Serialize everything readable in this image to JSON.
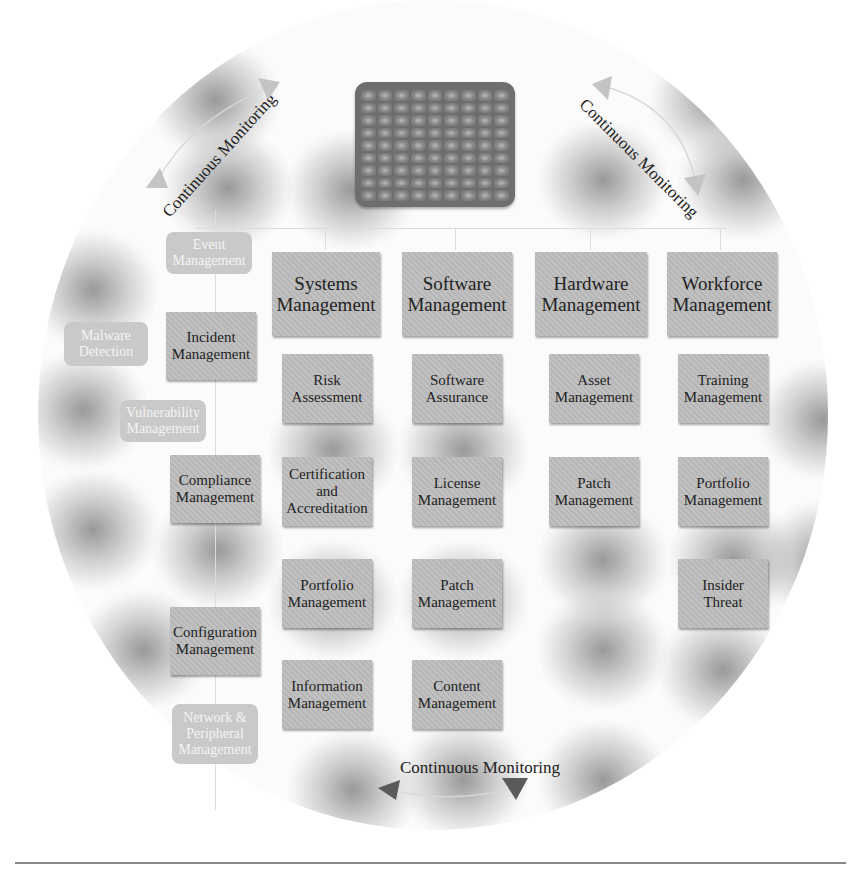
{
  "diagram": {
    "hub": {
      "icon": "server-grid-icon",
      "rows": 9,
      "cols": 9
    },
    "cycle_labels": [
      {
        "id": "top-left",
        "label": "Continuous Monitoring"
      },
      {
        "id": "top-right",
        "label": "Continuous Monitoring"
      },
      {
        "id": "bottom",
        "label": "Continuous Monitoring"
      }
    ],
    "columns": [
      {
        "header": "Systems\nManagement",
        "items": [
          "Risk\nAssessment",
          "Certification\nand\nAccreditation",
          "Portfolio\nManagement",
          "Information\nManagement"
        ]
      },
      {
        "header": "Software\nManagement",
        "items": [
          "Software\nAssurance",
          "License\nManagement",
          "Patch\nManagement",
          "Content\nManagement"
        ]
      },
      {
        "header": "Hardware\nManagement",
        "items": [
          "Asset\nManagement",
          "Patch\nManagement"
        ]
      },
      {
        "header": "Workforce\nManagement",
        "items": [
          "Training\nManagement",
          "Portfolio\nManagement",
          "Insider\nThreat"
        ]
      }
    ],
    "left_chain": {
      "main": [
        "Incident\nManagement",
        "Compliance\nManagement",
        "Configuration\nManagement"
      ],
      "faded": [
        "Event\nManagement",
        "Malware\nDetection",
        "Vulnerability\nManagement",
        "Network &\nPeripheral\nManagement"
      ]
    },
    "colors": {
      "box_fill": "#bdbdbd",
      "faded_box_fill": "#c9c9c9",
      "hub_fill": "#6e6e6e",
      "arrow_dark": "#5a5a5a",
      "arrow_light": "#bcbcbc",
      "text": "#222222"
    }
  }
}
